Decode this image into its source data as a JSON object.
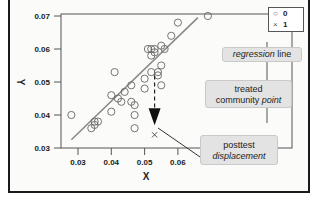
{
  "chart_data": {
    "type": "scatter",
    "title": "",
    "xlabel": "X",
    "ylabel": "Y",
    "xlim": [
      0.027,
      0.071
    ],
    "ylim": [
      0.03,
      0.071
    ],
    "x_ticks": [
      "0.03",
      "0.04",
      "0.05",
      "0.06"
    ],
    "y_ticks": [
      "0.03",
      "0.04",
      "0.05",
      "0.06",
      "0.07"
    ],
    "grid": false,
    "legend": {
      "position": "top-right outside",
      "entries": [
        {
          "symbol": "circle",
          "label": "0"
        },
        {
          "symbol": "x",
          "label": "1"
        }
      ]
    },
    "series": [
      {
        "name": "0",
        "marker": "circle",
        "points": [
          [
            0.028,
            0.04
          ],
          [
            0.034,
            0.036
          ],
          [
            0.035,
            0.038
          ],
          [
            0.035,
            0.037
          ],
          [
            0.036,
            0.038
          ],
          [
            0.04,
            0.041
          ],
          [
            0.04,
            0.046
          ],
          [
            0.041,
            0.053
          ],
          [
            0.042,
            0.045
          ],
          [
            0.043,
            0.044
          ],
          [
            0.044,
            0.047
          ],
          [
            0.046,
            0.044
          ],
          [
            0.046,
            0.049
          ],
          [
            0.047,
            0.04
          ],
          [
            0.047,
            0.043
          ],
          [
            0.047,
            0.036
          ],
          [
            0.05,
            0.051
          ],
          [
            0.05,
            0.048
          ],
          [
            0.051,
            0.06
          ],
          [
            0.052,
            0.06
          ],
          [
            0.052,
            0.058
          ],
          [
            0.053,
            0.059
          ],
          [
            0.053,
            0.06
          ],
          [
            0.054,
            0.053
          ],
          [
            0.054,
            0.052
          ],
          [
            0.055,
            0.055
          ],
          [
            0.055,
            0.061
          ],
          [
            0.056,
            0.06
          ],
          [
            0.055,
            0.049
          ],
          [
            0.058,
            0.064
          ],
          [
            0.06,
            0.068
          ],
          [
            0.069,
            0.07
          ],
          [
            0.052,
            0.053
          ]
        ]
      },
      {
        "name": "1",
        "marker": "x",
        "points": [
          [
            0.053,
            0.034
          ]
        ]
      }
    ],
    "regression_line": {
      "x": [
        0.028,
        0.066
      ],
      "y": [
        0.0325,
        0.0695
      ]
    },
    "annotations": [
      {
        "text": "regression line",
        "italic_part": "regression"
      },
      {
        "text": "treated community point",
        "italic_part": "point"
      },
      {
        "text": "posttest displacement",
        "italic_part": "displacement"
      }
    ],
    "displacement_arrow": {
      "from": [
        0.053,
        0.052
      ],
      "to": [
        0.053,
        0.036
      ]
    }
  },
  "legend": {
    "items": [
      {
        "symbol": "○",
        "label": "0"
      },
      {
        "symbol": "×",
        "label": "1"
      }
    ]
  },
  "callouts": {
    "regression": {
      "italic": "regression",
      "plain": " line"
    },
    "treated": {
      "line1": "treated",
      "plain": "community ",
      "italic": "point"
    },
    "posttest": {
      "line1": "posttest",
      "italic": "displacement"
    }
  },
  "axes": {
    "x_title": "X",
    "y_title": "Y",
    "x_ticks": [
      "0.03",
      "0.04",
      "0.05",
      "0.06"
    ],
    "y_ticks": [
      "0.07",
      "0.06",
      "0.05",
      "0.04",
      "0.03"
    ]
  },
  "colors": {
    "regression_line": "#8a8a8a",
    "marker": "#666666",
    "callout_fill": "#e3e3e3",
    "frame": "#1a1a1a"
  }
}
